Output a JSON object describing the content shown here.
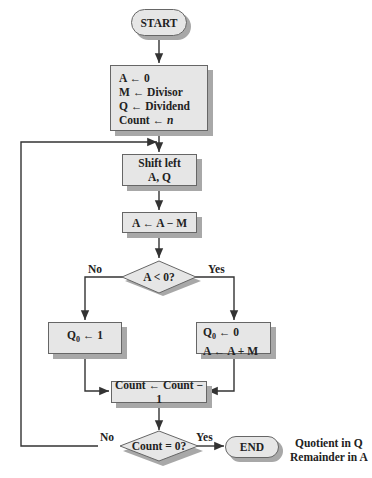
{
  "flowchart": {
    "start": "START",
    "init": {
      "line1": "A ← 0",
      "line2": "M ← Divisor",
      "line3": "Q ← Dividend",
      "line4_prefix": "Count ← ",
      "line4_var": "n"
    },
    "shift": {
      "line1": "Shift left",
      "line2": "A, Q"
    },
    "subtract": "A ← A − M",
    "decision1": {
      "text": "A < 0?",
      "no_label": "No",
      "yes_label": "Yes"
    },
    "set_q1": {
      "q": "Q",
      "sub": "0",
      "rest": " ← 1"
    },
    "restore": {
      "q": "Q",
      "sub": "0",
      "rest": " ← 0",
      "line2": "A ← A + M"
    },
    "decrement": "Count ← Count − 1",
    "decision2": {
      "text": "Count = 0?",
      "no_label": "No",
      "yes_label": "Yes"
    },
    "end": "END",
    "result_note": {
      "line1": "Quotient in Q",
      "line2": "Remainder in A"
    }
  },
  "colors": {
    "box_fill": "#e6e6e6",
    "shadow": "#a8a8a8",
    "line": "#333333"
  }
}
